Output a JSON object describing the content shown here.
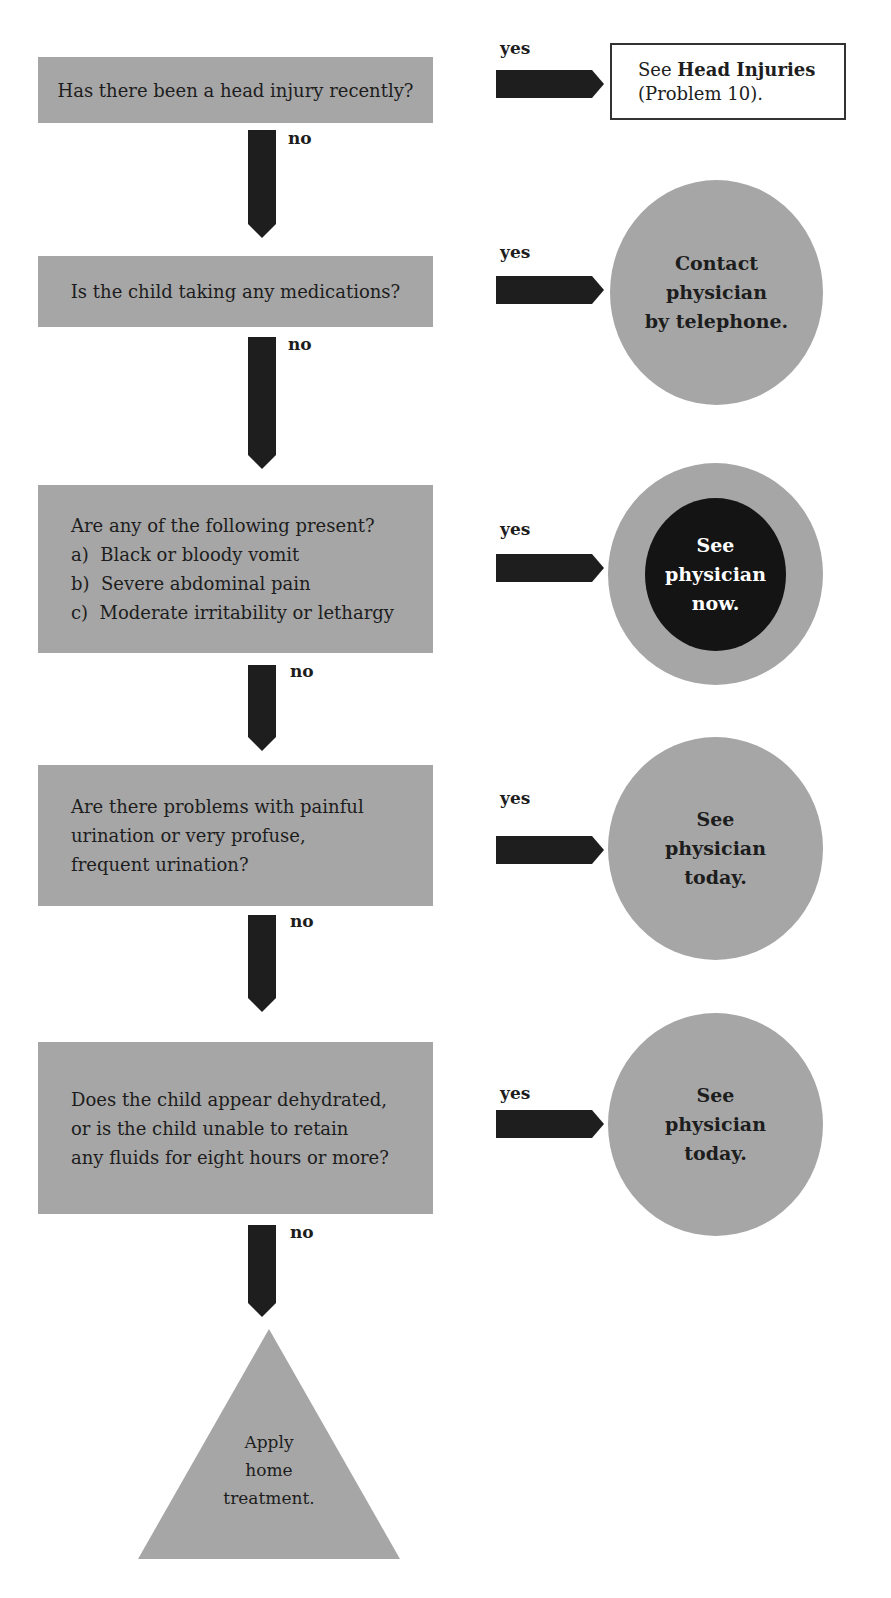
{
  "flowchart": {
    "colors": {
      "box_fill": "#a6a6a6",
      "arrow_fill": "#1e1e1e",
      "urgent_fill": "#141414",
      "text": "#1d1d1d"
    },
    "branch_labels": {
      "yes": "yes",
      "no": "no"
    },
    "steps": [
      {
        "question": [
          "Has there been a head injury recently?"
        ],
        "yes_outcome": {
          "shape": "rectangle-outline",
          "prefix": "See ",
          "bold": "Head Injuries",
          "suffix": "(Problem 10)."
        }
      },
      {
        "question": [
          "Is the child taking any medications?"
        ],
        "yes_outcome": {
          "shape": "circle",
          "lines": [
            "Contact",
            "physician",
            "by telephone."
          ]
        }
      },
      {
        "question": [
          "Are any of the following present?",
          "a)  Black or bloody vomit",
          "b)  Severe abdominal pain",
          "c)  Moderate irritability or lethargy"
        ],
        "yes_outcome": {
          "shape": "circle-urgent",
          "lines": [
            "See",
            "physician",
            "now."
          ]
        }
      },
      {
        "question": [
          "Are there problems with painful",
          "urination or very profuse,",
          "frequent urination?"
        ],
        "yes_outcome": {
          "shape": "circle",
          "lines": [
            "See",
            "physician",
            "today."
          ]
        }
      },
      {
        "question": [
          "Does the child appear dehydrated,",
          "or is the child unable to retain",
          "any fluids for eight hours or more?"
        ],
        "yes_outcome": {
          "shape": "circle",
          "lines": [
            "See",
            "physician",
            "today."
          ]
        }
      }
    ],
    "final_outcome": {
      "shape": "triangle",
      "lines": [
        "Apply",
        "home",
        "treatment."
      ]
    }
  }
}
